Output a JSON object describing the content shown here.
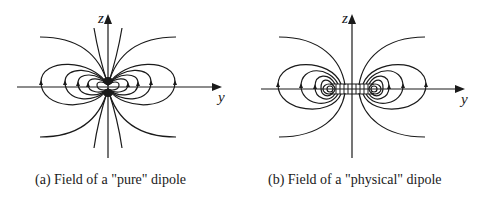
{
  "figure": {
    "panels": [
      {
        "id": "a",
        "caption": "(a) Field of a \"pure\" dipole",
        "axes": {
          "vertical": "z",
          "horizontal": "y"
        },
        "description": "Field lines of a point (pure) dipole: nested closed loops all meeting at a single point at the origin, plus open outer curves"
      },
      {
        "id": "b",
        "caption": "(b) Field of a \"physical\" dipole",
        "axes": {
          "vertical": "z",
          "horizontal": "y"
        },
        "description": "Field lines of a physical dipole: loops centered on two separated charges along the y axis, with parallel vertical field lines between them"
      }
    ],
    "colors": {
      "line": "#1a1a1a",
      "background": "#ffffff"
    }
  }
}
